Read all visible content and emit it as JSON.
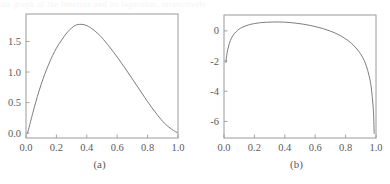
{
  "figure": {
    "ghost_text": "the  graph  of  the  function  and  its  logarithm,  respectively",
    "background": "#ffffff",
    "axis_color": "#9a9a9a",
    "curve_color": "#6e6e6e",
    "text_color": "#5a5a5a"
  },
  "panels": [
    {
      "id": "a",
      "caption": "(a)",
      "xlabel": "",
      "ylabel": "",
      "xticks": [
        "0.0",
        "0.2",
        "0.4",
        "0.6",
        "0.8",
        "1.0"
      ],
      "xtick_values": [
        0.0,
        0.2,
        0.4,
        0.6,
        0.8,
        1.0
      ],
      "yticks": [
        "0.0",
        "0.5",
        "1.0",
        "1.5"
      ],
      "ytick_values": [
        0.0,
        0.5,
        1.0,
        1.5
      ],
      "xlim": [
        0.0,
        1.0
      ],
      "ylim": [
        -0.08,
        1.95
      ]
    },
    {
      "id": "b",
      "caption": "(b)",
      "xlabel": "",
      "ylabel": "",
      "xticks": [
        "0.0",
        "0.2",
        "0.4",
        "0.6",
        "0.8",
        "1.0"
      ],
      "xtick_values": [
        0.0,
        0.2,
        0.4,
        0.6,
        0.8,
        1.0
      ],
      "yticks": [
        "0",
        "-2",
        "-4",
        "-6"
      ],
      "ytick_values": [
        0,
        -2,
        -4,
        -6
      ],
      "xlim": [
        0.0,
        1.0
      ],
      "ylim": [
        -7.1,
        1.05
      ]
    }
  ],
  "chart_data": [
    {
      "type": "line",
      "panel": "a",
      "title": "",
      "subtitle": "",
      "xlabel": "",
      "ylabel": "",
      "caption": "(a)",
      "grid": false,
      "legend": "none",
      "xlim": [
        0.0,
        1.0
      ],
      "ylim": [
        -0.08,
        1.95
      ],
      "xticks": [
        0.0,
        0.2,
        0.4,
        0.6,
        0.8,
        1.0
      ],
      "yticks": [
        0.0,
        0.5,
        1.0,
        1.5
      ],
      "series": [
        {
          "name": "curve-a",
          "color": "#6e6e6e",
          "x": [
            0.01,
            0.025,
            0.05,
            0.075,
            0.1,
            0.125,
            0.15,
            0.175,
            0.2,
            0.225,
            0.25,
            0.275,
            0.3,
            0.325,
            0.35,
            0.375,
            0.4,
            0.425,
            0.45,
            0.475,
            0.5,
            0.55,
            0.6,
            0.65,
            0.7,
            0.75,
            0.8,
            0.85,
            0.9,
            0.94,
            0.97,
            0.985,
            0.995
          ],
          "y": [
            0.0,
            0.14,
            0.38,
            0.6,
            0.8,
            0.975,
            1.13,
            1.27,
            1.39,
            1.49,
            1.58,
            1.66,
            1.72,
            1.765,
            1.78,
            1.778,
            1.76,
            1.725,
            1.68,
            1.625,
            1.56,
            1.41,
            1.245,
            1.07,
            0.885,
            0.7,
            0.515,
            0.345,
            0.19,
            0.098,
            0.045,
            0.022,
            0.008
          ]
        }
      ]
    },
    {
      "type": "line",
      "panel": "b",
      "title": "",
      "subtitle": "",
      "xlabel": "",
      "ylabel": "",
      "caption": "(b)",
      "grid": false,
      "legend": "none",
      "xlim": [
        0.0,
        1.0
      ],
      "ylim": [
        -7.1,
        1.05
      ],
      "xticks": [
        0.0,
        0.2,
        0.4,
        0.6,
        0.8,
        1.0
      ],
      "yticks": [
        0,
        -2,
        -4,
        -6
      ],
      "series": [
        {
          "name": "curve-b",
          "color": "#6e6e6e",
          "x": [
            0.012,
            0.018,
            0.025,
            0.035,
            0.05,
            0.07,
            0.09,
            0.11,
            0.14,
            0.17,
            0.2,
            0.24,
            0.28,
            0.32,
            0.36,
            0.4,
            0.44,
            0.48,
            0.52,
            0.56,
            0.6,
            0.65,
            0.7,
            0.75,
            0.8,
            0.84,
            0.88,
            0.91,
            0.935,
            0.955,
            0.968,
            0.978,
            0.984,
            0.988
          ],
          "y": [
            -2.1,
            -1.62,
            -1.22,
            -0.84,
            -0.46,
            -0.16,
            0.04,
            0.18,
            0.32,
            0.42,
            0.48,
            0.54,
            0.57,
            0.585,
            0.59,
            0.575,
            0.545,
            0.5,
            0.445,
            0.37,
            0.285,
            0.15,
            -0.02,
            -0.235,
            -0.53,
            -0.84,
            -1.27,
            -1.72,
            -2.28,
            -3.0,
            -3.7,
            -4.65,
            -5.5,
            -6.8
          ]
        }
      ]
    }
  ]
}
